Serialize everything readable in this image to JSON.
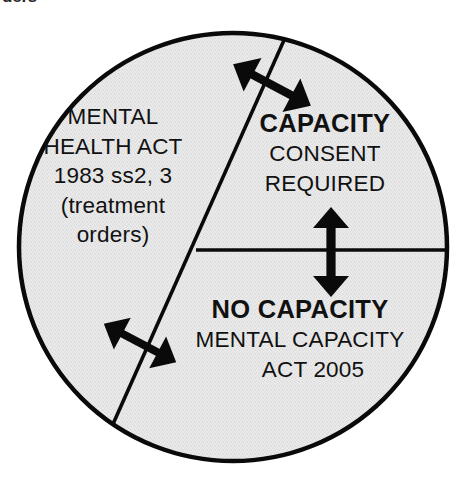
{
  "page": {
    "top_fragment_text": "ders",
    "background_color": "#ffffff"
  },
  "diagram": {
    "shape": "circle",
    "fill_color": "#e7e7e7",
    "stroke_color": "#000000",
    "sectors": [
      {
        "name": "mental-health-act",
        "lines": [
          "MENTAL",
          "HEALTH ACT",
          "1983 ss2, 3",
          "(treatment",
          "orders)"
        ],
        "emphasis": "normal"
      },
      {
        "name": "capacity",
        "heading": "CAPACITY",
        "lines": [
          "CONSENT",
          "REQUIRED"
        ],
        "emphasis": "bold-heading"
      },
      {
        "name": "no-capacity",
        "heading": "NO CAPACITY",
        "lines": [
          "MENTAL CAPACITY",
          "ACT 2005"
        ],
        "emphasis": "bold-heading"
      }
    ],
    "dividers": [
      {
        "name": "diagonal-divider",
        "from": [
          288,
          30
        ],
        "to": [
          111,
          428
        ]
      },
      {
        "name": "horizontal-divider",
        "from": [
          196,
          250
        ],
        "to": [
          449,
          250
        ]
      }
    ],
    "arrows": [
      {
        "name": "arrow-top-diagonal",
        "orientation": "double-headed",
        "direction": "upper-left / lower-right",
        "crosses": "diagonal-divider"
      },
      {
        "name": "arrow-bottom-diagonal",
        "orientation": "double-headed",
        "direction": "upper-left / lower-right",
        "crosses": "diagonal-divider"
      },
      {
        "name": "arrow-vertical",
        "orientation": "double-headed",
        "direction": "up / down",
        "crosses": "horizontal-divider"
      }
    ]
  }
}
